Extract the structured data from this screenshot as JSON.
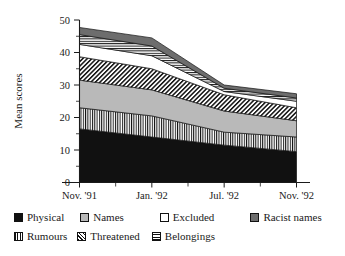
{
  "chart_data": {
    "type": "area",
    "title": "",
    "subtitle": "",
    "xlabel": "",
    "ylabel": "Mean scores",
    "ylim": [
      0,
      50
    ],
    "yticks": [
      0,
      10,
      20,
      30,
      40,
      50
    ],
    "ytick_labels": [
      "0",
      "10",
      "20",
      "30",
      "40",
      "50"
    ],
    "y_minor_ticks": [
      5,
      15,
      25,
      35,
      45
    ],
    "grid": false,
    "stacked": true,
    "legend_position": "below",
    "categories": [
      "Nov. '91",
      "Jan. '92",
      "Jul. '92",
      "Nov. '92"
    ],
    "x": [
      0,
      1,
      2,
      3
    ],
    "series": [
      {
        "name": "Physical",
        "fill": "solid-black",
        "values": [
          16.5,
          14.0,
          11.5,
          9.5
        ]
      },
      {
        "name": "Rumours",
        "fill": "vertical",
        "values": [
          6.5,
          6.5,
          4.0,
          4.5
        ]
      },
      {
        "name": "Names",
        "fill": "light-gray",
        "values": [
          8.5,
          8.0,
          6.5,
          5.0
        ]
      },
      {
        "name": "Threatened",
        "fill": "diagonal",
        "values": [
          7.2,
          6.5,
          5.0,
          4.0
        ]
      },
      {
        "name": "Excluded",
        "fill": "white",
        "values": [
          3.8,
          4.0,
          1.0,
          2.0
        ]
      },
      {
        "name": "Belongings",
        "fill": "horizontal",
        "values": [
          3.0,
          3.0,
          1.0,
          1.0
        ]
      },
      {
        "name": "Racist names",
        "fill": "dark-gray",
        "values": [
          2.2,
          2.5,
          1.0,
          1.3
        ]
      }
    ],
    "cumulative_tops": {
      "Physical": [
        16.5,
        14.0,
        11.5,
        9.5
      ],
      "Rumours": [
        23.0,
        20.5,
        15.5,
        14.0
      ],
      "Names": [
        31.5,
        28.5,
        22.0,
        19.0
      ],
      "Threatened": [
        38.7,
        35.0,
        27.0,
        23.0
      ],
      "Excluded": [
        42.5,
        39.0,
        28.0,
        25.0
      ],
      "Belongings": [
        45.5,
        42.0,
        29.0,
        26.0
      ],
      "Racist names": [
        47.7,
        44.5,
        30.0,
        27.3
      ]
    }
  },
  "axes": {
    "y_title": "Mean scores",
    "y_tick_labels": [
      "50",
      "40",
      "30",
      "20",
      "10",
      "0"
    ],
    "x_tick_labels": [
      "Nov. '91",
      "Jan. '92",
      "Jul. '92",
      "Nov. '92"
    ]
  },
  "legend": {
    "row1": [
      {
        "label": "Physical",
        "swatch": "solid-black"
      },
      {
        "label": "Names",
        "swatch": "light-gray"
      },
      {
        "label": "Excluded",
        "swatch": "white"
      },
      {
        "label": "Racist names",
        "swatch": "dark-gray"
      }
    ],
    "row2": [
      {
        "label": "Rumours",
        "swatch": "vertical"
      },
      {
        "label": "Threatened",
        "swatch": "diagonal"
      },
      {
        "label": "Belongings",
        "swatch": "horizontal"
      }
    ]
  },
  "colors": {
    "ink": "#111111",
    "light_gray": "#b9b9b9",
    "dark_gray": "#6d6d6d",
    "white": "#ffffff"
  }
}
